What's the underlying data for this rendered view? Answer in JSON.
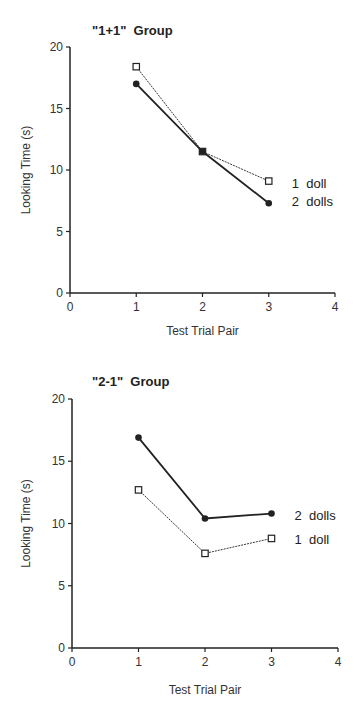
{
  "chart_data": [
    {
      "type": "line",
      "title": "\"1+1\"  Group",
      "xlabel": "Test Trial Pair",
      "ylabel": "Looking Time (s)",
      "x": [
        1,
        2,
        3
      ],
      "xlim": [
        0,
        4
      ],
      "ylim": [
        0,
        20
      ],
      "xticks": [
        "0",
        "1",
        "2",
        "3",
        "4"
      ],
      "yticks": [
        "0",
        "5",
        "10",
        "15",
        "20"
      ],
      "grid": false,
      "legend_position": "right, inline labels",
      "series": [
        {
          "name": "1 doll",
          "marker": "open-square",
          "line": "dotted-thin",
          "values": [
            18.4,
            11.5,
            9.1
          ]
        },
        {
          "name": "2 dolls",
          "marker": "filled-circle",
          "line": "solid-thick",
          "values": [
            17.0,
            11.5,
            7.3
          ]
        }
      ]
    },
    {
      "type": "line",
      "title": "\"2-1\"  Group",
      "xlabel": "Test Trial Pair",
      "ylabel": "Looking Time (s)",
      "x": [
        1,
        2,
        3
      ],
      "xlim": [
        0,
        4
      ],
      "ylim": [
        0,
        20
      ],
      "xticks": [
        "0",
        "1",
        "2",
        "3",
        "4"
      ],
      "yticks": [
        "0",
        "5",
        "10",
        "15",
        "20"
      ],
      "grid": false,
      "legend_position": "right, inline labels",
      "series": [
        {
          "name": "2 dolls",
          "marker": "filled-circle",
          "line": "solid-thick",
          "values": [
            16.9,
            10.4,
            10.8
          ]
        },
        {
          "name": "1 doll",
          "marker": "open-square",
          "line": "dotted-thin",
          "values": [
            12.7,
            7.6,
            8.8
          ]
        }
      ]
    }
  ]
}
